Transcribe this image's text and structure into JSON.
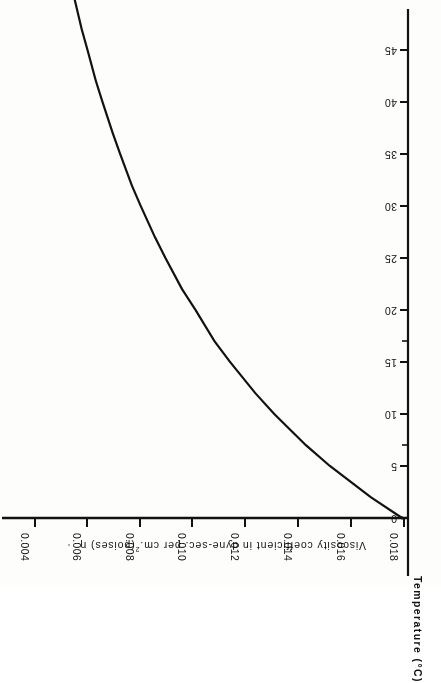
{
  "figure": {
    "orientation_note": "page-rotated-180",
    "ink_color": "#121212",
    "paper_color": "#fdfdfb"
  },
  "axes": {
    "viscosity": {
      "title_main": "Viscosity  coefficient  in   dyne-sec. per  cm.",
      "title_sup": "2",
      "title_tail": "(poises)  η",
      "ticks": [
        "0.004",
        "0.006",
        "0.008",
        "0.010",
        "0.012",
        "0.014",
        "0.016",
        "0.018"
      ],
      "range": [
        0.004,
        0.018
      ]
    },
    "temperature": {
      "title": "Temperature",
      "units": "(°C)",
      "ticks": [
        "0",
        "5",
        "10",
        "15",
        "20",
        "25",
        "30",
        "35",
        "40",
        "45"
      ],
      "minor_ticks": [
        "7",
        "17"
      ],
      "range": [
        0,
        48
      ]
    }
  },
  "chart_data": {
    "type": "line",
    "title": "",
    "xlabel": "Viscosity coefficient in dyne-sec. per cm.2 (poises) η",
    "ylabel": "Temperature (°C)",
    "grid": false,
    "legend": "none",
    "note": "Plotted with temperature on the vertical axis and viscosity on the horizontal axis; whole figure appears rotated 180 degrees on the page.",
    "xlim": [
      0.018,
      0.004
    ],
    "ylim": [
      0,
      48
    ],
    "series": [
      {
        "name": "Viscosity of water",
        "x_temperature_C": [
          0,
          2,
          5,
          7,
          10,
          12,
          15,
          17,
          20,
          22,
          25,
          27,
          30,
          32,
          35,
          37,
          40,
          42,
          45,
          47,
          50
        ],
        "y_viscosity_poises": [
          0.01793,
          0.01674,
          0.01519,
          0.01428,
          0.01308,
          0.01236,
          0.0114,
          0.01081,
          0.01009,
          0.00958,
          0.00895,
          0.00855,
          0.00801,
          0.00767,
          0.00723,
          0.00695,
          0.00656,
          0.00631,
          0.00599,
          0.00577,
          0.00549
        ]
      }
    ]
  }
}
